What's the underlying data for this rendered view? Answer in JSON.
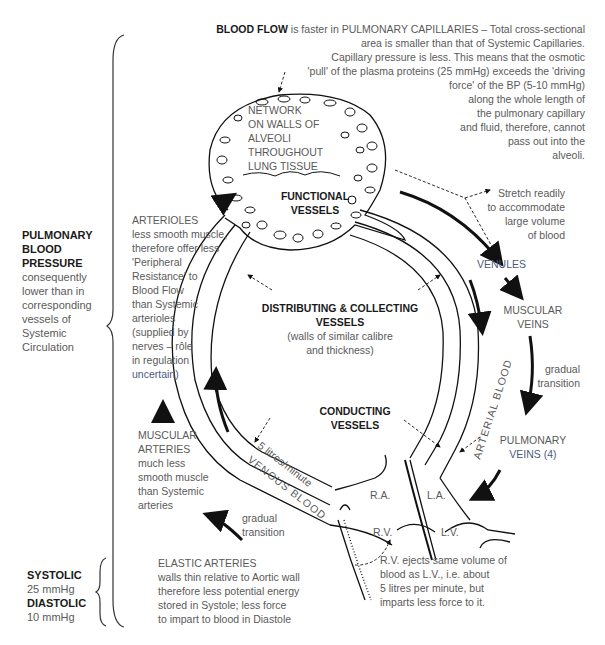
{
  "header": {
    "bold": "BLOOD FLOW",
    "line1": " is faster in PULMONARY CAPILLARIES – Total cross-sectional",
    "line2": "area is smaller than that of Systemic Capillaries.",
    "line3": "Capillary pressure is less.  This means that the osmotic",
    "line4": "'pull' of the plasma proteins (25 mmHg) exceeds the 'driving",
    "line5": "force' of the BP (5-10 mmHg)",
    "line6": "along the whole length of",
    "line7": "the pulmonary capillary",
    "line8": "and fluid, therefore, cannot",
    "line9": "pass out into the",
    "line10": "alveoli."
  },
  "network": [
    "NETWORK",
    "ON WALLS OF",
    "ALVEOLI",
    "THROUGHOUT",
    "LUNG TISSUE"
  ],
  "functional": [
    "FUNCTIONAL",
    "VESSELS"
  ],
  "stretch": [
    "Stretch readily",
    "to accommodate",
    "large volume",
    "of blood"
  ],
  "pulmonary_bp": {
    "title": [
      "PULMONARY",
      "BLOOD",
      "PRESSURE"
    ],
    "body": [
      "consequently",
      "lower than in",
      "corresponding",
      "vessels of",
      "Systemic",
      "Circulation"
    ]
  },
  "arterioles": {
    "title": "ARTERIOLES",
    "body": [
      "less smooth muscle,",
      "therefore offer less",
      "'Peripheral",
      "Resistance' to",
      "Blood Flow",
      "than Systemic",
      "arterioles",
      "(supplied by",
      "nerves – rôle",
      "in regulation",
      "uncertain)"
    ]
  },
  "distributing": {
    "title": [
      "DISTRIBUTING & COLLECTING",
      "VESSELS"
    ],
    "body": [
      "(walls of similar calibre",
      "and thickness)"
    ]
  },
  "conducting": [
    "CONDUCTING",
    "VESSELS"
  ],
  "venules": "VENULES",
  "muscular_veins": [
    "MUSCULAR",
    "VEINS"
  ],
  "gradual_right": [
    "gradual",
    "transition"
  ],
  "pulmonary_veins": [
    "PULMONARY",
    "VEINS (4)"
  ],
  "muscular_arteries": {
    "title": [
      "MUSCULAR",
      "ARTERIES"
    ],
    "body": [
      "much less",
      "smooth muscle",
      "than Systemic",
      "arteries"
    ]
  },
  "gradual_left": [
    "gradual",
    "transition"
  ],
  "loop_labels": {
    "flow_rate": "5 litres/minute",
    "venous": "VENOUS BLOOD",
    "arterial": "ARTERIAL BLOOD"
  },
  "heart": {
    "ra": "R.A.",
    "la": "L.A.",
    "rv": "R.V.",
    "lv": "L.V."
  },
  "rv_note": [
    "R.V. ejects same volume of",
    "blood as L.V., i.e. about",
    "5 litres per minute, but",
    "imparts less force to it."
  ],
  "elastic": {
    "title": "ELASTIC ARTERIES",
    "body": [
      "walls thin relative to Aortic wall",
      "therefore less potential energy",
      "stored in Systole; less force",
      "to impart to blood in Diastole"
    ]
  },
  "pressures": {
    "systolic_label": "SYSTOLIC",
    "systolic_value": "25 mmHg",
    "diastolic_label": "DIASTOLIC",
    "diastolic_value": "10 mmHg"
  },
  "colors": {
    "text": "#5a5a5a",
    "bold": "#1a1a1a",
    "line": "#111111",
    "accent": "#4a5a80"
  }
}
